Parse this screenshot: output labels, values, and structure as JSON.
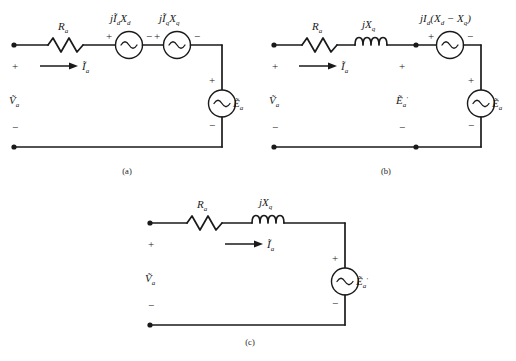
{
  "figure": {
    "background_color": "#ffffff",
    "line_color": "#1a1a1a"
  },
  "circuits": [
    {
      "id": "a",
      "caption": "(a)",
      "elements": {
        "resistor_label": "R",
        "resistor_sub": "a",
        "source1_label": "jĨ",
        "source1_sub1": "d",
        "source1_mid": "X",
        "source1_sub2": "d",
        "source2_label": "jĨ",
        "source2_sub1": "q",
        "source2_mid": "X",
        "source2_sub2": "q",
        "right_source_label": "Ẽ",
        "right_source_sub": "a",
        "terminal_voltage": "Ṽ",
        "terminal_voltage_sub": "a",
        "current_label": "Ĩ",
        "current_sub": "a",
        "plus": "+",
        "minus": "−"
      }
    },
    {
      "id": "b",
      "caption": "(b)",
      "elements": {
        "resistor_label": "R",
        "resistor_sub": "a",
        "inductor_label": "jX",
        "inductor_sub": "q",
        "source_label_pre": "jI",
        "source_label_sub1": "d",
        "source_label_paren_open": "(X",
        "source_label_sub2": "d",
        "source_label_minus": " − X",
        "source_label_sub3": "q",
        "source_label_paren_close": ")",
        "mid_source_label": "Ẽ",
        "mid_source_prime": "′",
        "mid_source_sub": "a",
        "right_source_label": "Ẽ",
        "right_source_sub": "a",
        "terminal_voltage": "Ṽ",
        "terminal_voltage_sub": "a",
        "current_label": "Ĩ",
        "current_sub": "a",
        "plus": "+",
        "minus": "−"
      }
    },
    {
      "id": "c",
      "caption": "(c)",
      "elements": {
        "resistor_label": "R",
        "resistor_sub": "a",
        "inductor_label": "jX",
        "inductor_sub": "q",
        "right_source_label": "Ẽ",
        "right_source_prime": "′",
        "right_source_sub": "a",
        "terminal_voltage": "Ṽ",
        "terminal_voltage_sub": "a",
        "current_label": "Ĩ",
        "current_sub": "a",
        "plus": "+",
        "minus": "−"
      }
    }
  ]
}
